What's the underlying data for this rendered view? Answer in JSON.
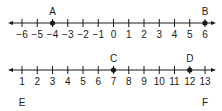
{
  "diagram": {
    "type": "number-lines",
    "number_lines": [
      {
        "id": "line1",
        "ticks": [
          -6,
          -5,
          -4,
          -3,
          -2,
          -1,
          0,
          1,
          2,
          3,
          4,
          5,
          6
        ],
        "tick_labels": [
          "−6",
          "−5",
          "−4",
          "−3",
          "−2",
          "−1",
          "0",
          "1",
          "2",
          "3",
          "4",
          "5",
          "6"
        ],
        "points": [
          {
            "label": "A",
            "value": -4
          },
          {
            "label": "B",
            "value": 6
          }
        ]
      },
      {
        "id": "line2",
        "ticks": [
          1,
          2,
          3,
          4,
          5,
          6,
          7,
          8,
          9,
          10,
          11,
          12,
          13
        ],
        "tick_labels": [
          "1",
          "2",
          "3",
          "4",
          "5",
          "6",
          "7",
          "8",
          "9",
          "10",
          "11",
          "12",
          "13"
        ],
        "points": [
          {
            "label": "C",
            "value": 7
          },
          {
            "label": "D",
            "value": 12
          }
        ]
      }
    ],
    "third_line_labels": {
      "left": "E",
      "right": "F"
    }
  },
  "colors": {
    "ink": "#1a1a1a",
    "background": "#ffffff"
  }
}
